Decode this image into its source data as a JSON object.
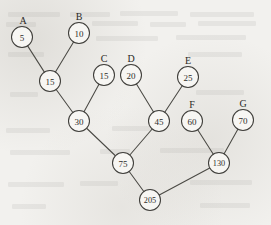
{
  "figure": {
    "kind": "huffman-tree",
    "background_color": "#f2f1ee",
    "ink_color": "#3f3e3a",
    "node_fill": "#f7f6f3",
    "node_radius": 10.5
  },
  "chart_data": {
    "type": "diagram",
    "title": "",
    "xlabel": "",
    "ylabel": "",
    "nodes": [
      {
        "id": "A",
        "value": "5",
        "label": "A",
        "x": 22,
        "y": 37,
        "label_x": 23,
        "label_y": 24,
        "leaf": true
      },
      {
        "id": "B",
        "value": "10",
        "label": "B",
        "x": 79,
        "y": 33,
        "label_x": 79,
        "label_y": 20,
        "leaf": true
      },
      {
        "id": "C",
        "value": "15",
        "label": "C",
        "x": 104,
        "y": 75,
        "label_x": 104,
        "label_y": 62,
        "leaf": true
      },
      {
        "id": "D",
        "value": "20",
        "label": "D",
        "x": 131,
        "y": 75,
        "label_x": 131,
        "label_y": 62,
        "leaf": true
      },
      {
        "id": "E",
        "value": "25",
        "label": "E",
        "x": 188,
        "y": 77,
        "label_x": 188,
        "label_y": 64,
        "leaf": true
      },
      {
        "id": "F",
        "value": "60",
        "label": "F",
        "x": 192,
        "y": 121,
        "label_x": 192,
        "label_y": 108,
        "leaf": true
      },
      {
        "id": "G",
        "value": "70",
        "label": "G",
        "x": 243,
        "y": 120,
        "label_x": 243,
        "label_y": 107,
        "leaf": true
      },
      {
        "id": "I15",
        "value": "15",
        "label": "",
        "x": 50,
        "y": 81,
        "label_x": 0,
        "label_y": 0,
        "leaf": false
      },
      {
        "id": "I30",
        "value": "30",
        "label": "",
        "x": 79,
        "y": 121,
        "label_x": 0,
        "label_y": 0,
        "leaf": false
      },
      {
        "id": "I45",
        "value": "45",
        "label": "",
        "x": 159,
        "y": 121,
        "label_x": 0,
        "label_y": 0,
        "leaf": false
      },
      {
        "id": "I75",
        "value": "75",
        "label": "",
        "x": 123,
        "y": 163,
        "label_x": 0,
        "label_y": 0,
        "leaf": false
      },
      {
        "id": "I130",
        "value": "130",
        "label": "",
        "x": 219,
        "y": 163,
        "label_x": 0,
        "label_y": 0,
        "leaf": false
      },
      {
        "id": "I205",
        "value": "205",
        "label": "",
        "x": 150,
        "y": 200,
        "label_x": 0,
        "label_y": 0,
        "leaf": false
      }
    ],
    "edges": [
      {
        "from": "A",
        "to": "I15"
      },
      {
        "from": "B",
        "to": "I15"
      },
      {
        "from": "I15",
        "to": "I30"
      },
      {
        "from": "C",
        "to": "I30"
      },
      {
        "from": "I30",
        "to": "I75"
      },
      {
        "from": "D",
        "to": "I45"
      },
      {
        "from": "E",
        "to": "I45"
      },
      {
        "from": "I45",
        "to": "I75"
      },
      {
        "from": "F",
        "to": "I130"
      },
      {
        "from": "G",
        "to": "I130"
      },
      {
        "from": "I75",
        "to": "I205"
      },
      {
        "from": "I130",
        "to": "I205"
      }
    ],
    "leaf_labels": [
      "A",
      "B",
      "C",
      "D",
      "E",
      "F",
      "G"
    ],
    "leaf_weights": [
      5,
      10,
      15,
      20,
      25,
      60,
      70
    ],
    "internal_weights": [
      15,
      30,
      45,
      75,
      130,
      205
    ],
    "root_value": "205"
  },
  "bleed_text_rows": [
    {
      "x": 8,
      "y": 12,
      "w": 52
    },
    {
      "x": 70,
      "y": 12,
      "w": 40
    },
    {
      "x": 120,
      "y": 11,
      "w": 58
    },
    {
      "x": 190,
      "y": 12,
      "w": 64
    },
    {
      "x": 6,
      "y": 22,
      "w": 30
    },
    {
      "x": 92,
      "y": 21,
      "w": 46
    },
    {
      "x": 150,
      "y": 22,
      "w": 36
    },
    {
      "x": 198,
      "y": 21,
      "w": 58
    },
    {
      "x": 96,
      "y": 36,
      "w": 62
    },
    {
      "x": 176,
      "y": 35,
      "w": 70
    },
    {
      "x": 8,
      "y": 52,
      "w": 36
    },
    {
      "x": 188,
      "y": 52,
      "w": 54
    },
    {
      "x": 10,
      "y": 92,
      "w": 28
    },
    {
      "x": 196,
      "y": 90,
      "w": 48
    },
    {
      "x": 6,
      "y": 128,
      "w": 44
    },
    {
      "x": 112,
      "y": 126,
      "w": 40
    },
    {
      "x": 10,
      "y": 150,
      "w": 60
    },
    {
      "x": 100,
      "y": 149,
      "w": 30
    },
    {
      "x": 160,
      "y": 148,
      "w": 64
    },
    {
      "x": 8,
      "y": 182,
      "w": 56
    },
    {
      "x": 80,
      "y": 181,
      "w": 38
    },
    {
      "x": 190,
      "y": 180,
      "w": 62
    },
    {
      "x": 12,
      "y": 204,
      "w": 34
    },
    {
      "x": 200,
      "y": 203,
      "w": 50
    }
  ]
}
